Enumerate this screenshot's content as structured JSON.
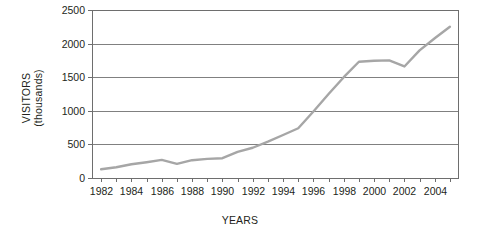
{
  "chart_data": {
    "type": "line",
    "title": "",
    "xlabel": "YEARS",
    "ylabel": "VISITORS (thousands)",
    "ylabel_lines": [
      "VISITORS",
      "(thousands)"
    ],
    "xlim": [
      1981.4,
      2005.6
    ],
    "ylim": [
      0,
      2500
    ],
    "grid": true,
    "legend": "none",
    "y_ticks": [
      0,
      500,
      1000,
      1500,
      2000,
      2500
    ],
    "y_tick_labels": [
      "0",
      "500",
      "1000",
      "1500",
      "2000",
      "2500"
    ],
    "x_ticks": [
      1982,
      1983,
      1984,
      1985,
      1986,
      1987,
      1988,
      1989,
      1990,
      1991,
      1992,
      1993,
      1994,
      1995,
      1996,
      1997,
      1998,
      1999,
      2000,
      2001,
      2002,
      2003,
      2004,
      2005
    ],
    "x_tick_labels": [
      "1982",
      "",
      "1984",
      "",
      "1986",
      "",
      "1988",
      "",
      "1990",
      "",
      "1992",
      "",
      "1994",
      "",
      "1996",
      "",
      "1998",
      "",
      "2000",
      "",
      "2002",
      "",
      "2004",
      ""
    ],
    "x": [
      1982,
      1983,
      1984,
      1985,
      1986,
      1987,
      1988,
      1989,
      1990,
      1991,
      1992,
      1993,
      1994,
      1995,
      1996,
      1997,
      1998,
      1999,
      2000,
      2001,
      2002,
      2003,
      2004,
      2005
    ],
    "values": [
      130,
      160,
      205,
      235,
      270,
      210,
      265,
      285,
      295,
      390,
      450,
      540,
      640,
      740,
      990,
      1250,
      1500,
      1730,
      1745,
      1750,
      1660,
      1900,
      2080,
      2250
    ],
    "series": [
      {
        "name": "Visitors",
        "color": "#a6a6a6",
        "values": [
          130,
          160,
          205,
          235,
          270,
          210,
          265,
          285,
          295,
          390,
          450,
          540,
          640,
          740,
          990,
          1250,
          1500,
          1730,
          1745,
          1750,
          1660,
          1900,
          2080,
          2250
        ]
      }
    ],
    "colors": {
      "line": "#a6a6a6",
      "grid": "#808080",
      "frame": "#6e6e6e",
      "text": "#231f20",
      "background": "#ffffff"
    }
  }
}
